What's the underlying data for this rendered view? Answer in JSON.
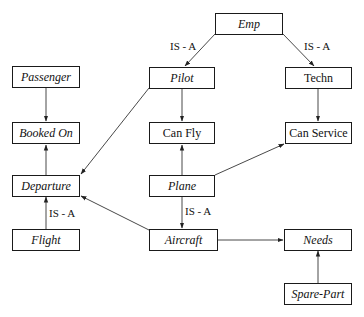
{
  "diagram": {
    "nodes": {
      "emp": {
        "label": "Emp",
        "italic": true
      },
      "pilot": {
        "label": "Pilot",
        "italic": true
      },
      "techn": {
        "label": "Techn",
        "italic": false
      },
      "passenger": {
        "label": "Passenger",
        "italic": true
      },
      "booked_on": {
        "label": "Booked On",
        "italic": true
      },
      "can_fly": {
        "label": "Can Fly",
        "italic": false
      },
      "can_service": {
        "label": "Can Service",
        "italic": false
      },
      "departure": {
        "label": "Departure",
        "italic": true
      },
      "plane": {
        "label": "Plane",
        "italic": true
      },
      "flight": {
        "label": "Flight",
        "italic": true
      },
      "aircraft": {
        "label": "Aircraft",
        "italic": true
      },
      "needs": {
        "label": "Needs",
        "italic": true
      },
      "spare_part": {
        "label": "Spare-Part",
        "italic": true
      }
    },
    "edges": [
      {
        "from": "Emp",
        "to": "Pilot",
        "label": "IS - A"
      },
      {
        "from": "Emp",
        "to": "Techn",
        "label": "IS - A"
      },
      {
        "from": "Passenger",
        "to": "Booked On",
        "label": ""
      },
      {
        "from": "Departure",
        "to": "Booked On",
        "label": ""
      },
      {
        "from": "Pilot",
        "to": "Can Fly",
        "label": ""
      },
      {
        "from": "Pilot",
        "to": "Departure",
        "label": ""
      },
      {
        "from": "Techn",
        "to": "Can Service",
        "label": ""
      },
      {
        "from": "Plane",
        "to": "Can Fly",
        "label": ""
      },
      {
        "from": "Plane",
        "to": "Can Service",
        "label": ""
      },
      {
        "from": "Plane",
        "to": "Aircraft",
        "label": "IS - A"
      },
      {
        "from": "Flight",
        "to": "Departure",
        "label": "IS - A"
      },
      {
        "from": "Aircraft",
        "to": "Departure",
        "label": ""
      },
      {
        "from": "Aircraft",
        "to": "Needs",
        "label": ""
      },
      {
        "from": "Spare-Part",
        "to": "Needs",
        "label": ""
      }
    ],
    "edge_labels": {
      "emp_pilot": "IS - A",
      "emp_techn": "IS - A",
      "plane_aircraft": "IS - A",
      "flight_departure": "IS - A"
    }
  }
}
